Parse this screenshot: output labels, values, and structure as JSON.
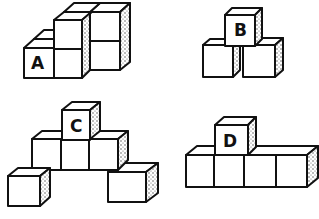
{
  "figures": [
    {
      "label": "A",
      "description": "multi-cube structure, stepped"
    },
    {
      "label": "B",
      "description": "three cubes, pyramid"
    },
    {
      "label": "C",
      "description": "six cubes, arched pyramid"
    },
    {
      "label": "D",
      "description": "five cubes, T-shape row"
    }
  ],
  "colors": {
    "line": "#111111",
    "background": "#ffffff",
    "shading": "#555555"
  }
}
